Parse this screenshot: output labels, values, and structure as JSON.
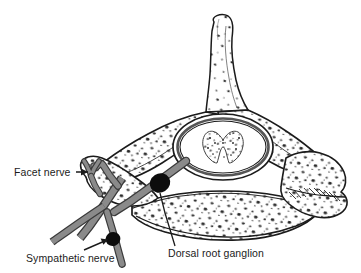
{
  "figure": {
    "view": "axial (transverse) section of a lumbar vertebra",
    "background_color": "#ffffff",
    "line_color": "#1b1b1b",
    "nerve_fill": "#8a8a8a",
    "nerve_stroke": "#3a3a3a",
    "ganglion_color": "#0d0d0d",
    "bone_fill": "#ffffff",
    "stipple_color": "#333333"
  },
  "labels": {
    "facet_nerve": "Facet nerve",
    "sympathetic_nerve": "Sympathetic nerve",
    "dorsal_root_ganglion": "Dorsal root ganglion"
  },
  "structures": {
    "spinous_process": "spinous process",
    "lamina": "lamina",
    "spinal_canal": "spinal canal",
    "spinal_cord": "spinal cord gray matter",
    "vertebral_body": "vertebral body",
    "transverse_process": "transverse process",
    "superior_articular_process": "superior articular process"
  },
  "icons": {
    "facet_pointer": "arrow-right-icon",
    "sympathetic_pointer": "leader-line-icon",
    "drg_pointer": "leader-line-icon"
  }
}
